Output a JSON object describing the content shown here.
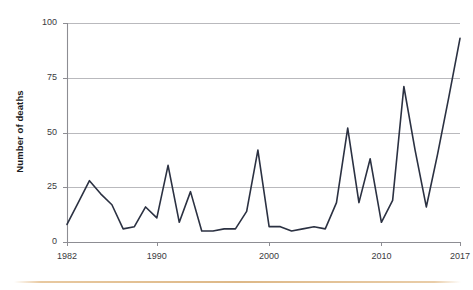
{
  "chart_data": {
    "type": "line",
    "title": "",
    "subtitle": "",
    "xlabel": "",
    "ylabel": "Number of deaths",
    "xlim": [
      1982,
      2017
    ],
    "ylim": [
      0,
      100
    ],
    "grid": true,
    "legend": false,
    "legend_position": "none",
    "y_ticks": [
      0,
      25,
      50,
      75,
      100
    ],
    "y_tick_labels": [
      "0",
      "25",
      "50",
      "75",
      "100"
    ],
    "x_ticks": [
      1982,
      1990,
      2000,
      2010,
      2017
    ],
    "x_tick_labels": [
      "1982",
      "1990",
      "2000",
      "2010",
      "2017"
    ],
    "line_color": "#2b3142",
    "line_width": 1.6,
    "x": [
      1982,
      1983,
      1984,
      1985,
      1986,
      1987,
      1988,
      1989,
      1990,
      1991,
      1992,
      1993,
      1994,
      1995,
      1996,
      1997,
      1998,
      1999,
      2000,
      2001,
      2002,
      2003,
      2004,
      2005,
      2006,
      2007,
      2008,
      2009,
      2010,
      2011,
      2012,
      2013,
      2014,
      2015,
      2016,
      2017
    ],
    "values": [
      8,
      18,
      28,
      22,
      17,
      6,
      7,
      16,
      11,
      35,
      9,
      23,
      5,
      5,
      6,
      6,
      14,
      42,
      7,
      7,
      5,
      6,
      7,
      6,
      18,
      52,
      18,
      38,
      9,
      19,
      71,
      42,
      16,
      40,
      66,
      93
    ],
    "series": [
      {
        "name": "Number of deaths",
        "values": [
          8,
          18,
          28,
          22,
          17,
          6,
          7,
          16,
          11,
          35,
          9,
          23,
          5,
          5,
          6,
          6,
          14,
          42,
          7,
          7,
          5,
          6,
          7,
          6,
          18,
          52,
          18,
          38,
          9,
          19,
          71,
          42,
          16,
          40,
          66,
          93
        ]
      }
    ],
    "annotations": []
  },
  "footer": {
    "rule_color": "#ddb887"
  }
}
